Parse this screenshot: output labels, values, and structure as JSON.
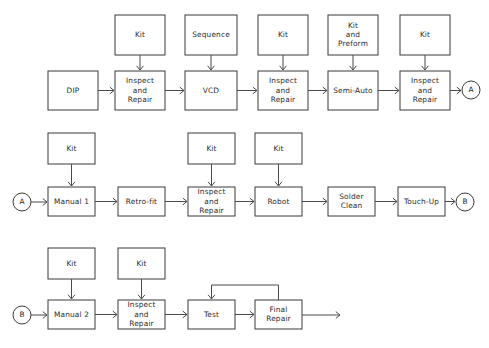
{
  "diagram": {
    "type": "process-flowchart",
    "background_color": "#ffffff",
    "line_color": "#4a4a4a",
    "box_stroke_color": "#3a3a3a",
    "text_color": "#2b2b2b",
    "rows": [
      {
        "id": "row-1",
        "feeder_boxes": [
          {
            "id": "r1-kit-1",
            "label": "Kit",
            "x": 115,
            "y": 15,
            "w": 50,
            "h": 40
          },
          {
            "id": "r1-sequence",
            "label": "Sequence",
            "x": 185,
            "y": 15,
            "w": 52,
            "h": 40
          },
          {
            "id": "r1-kit-2",
            "label": "Kit",
            "x": 258,
            "y": 15,
            "w": 50,
            "h": 40
          },
          {
            "id": "r1-kit-preform",
            "label": "Kit\nand\nPreform",
            "x": 328,
            "y": 15,
            "w": 50,
            "h": 40
          },
          {
            "id": "r1-kit-3",
            "label": "Kit",
            "x": 400,
            "y": 15,
            "w": 50,
            "h": 40
          }
        ],
        "process_boxes": [
          {
            "id": "r1-dip",
            "label": "DIP",
            "x": 48,
            "y": 71,
            "w": 50,
            "h": 39
          },
          {
            "id": "r1-inspect-1",
            "label": "Inspect\nand\nRepair",
            "x": 115,
            "y": 71,
            "w": 50,
            "h": 39
          },
          {
            "id": "r1-vcd",
            "label": "VCD",
            "x": 185,
            "y": 71,
            "w": 52,
            "h": 39
          },
          {
            "id": "r1-inspect-2",
            "label": "Inspect\nand\nRepair",
            "x": 258,
            "y": 71,
            "w": 50,
            "h": 39
          },
          {
            "id": "r1-semi-auto",
            "label": "Semi-Auto",
            "x": 328,
            "y": 71,
            "w": 50,
            "h": 39
          },
          {
            "id": "r1-inspect-3",
            "label": "Inspect\nand\nRepair",
            "x": 400,
            "y": 71,
            "w": 50,
            "h": 39
          }
        ],
        "connectors": [
          {
            "id": "r1-connector-a",
            "label": "A",
            "cx": 471,
            "cy": 90,
            "r": 9
          }
        ]
      },
      {
        "id": "row-2",
        "feeder_boxes": [
          {
            "id": "r2-kit-1",
            "label": "Kit",
            "x": 48,
            "y": 133,
            "w": 47,
            "h": 31
          },
          {
            "id": "r2-kit-2",
            "label": "Kit",
            "x": 188,
            "y": 133,
            "w": 47,
            "h": 31
          },
          {
            "id": "r2-kit-3",
            "label": "Kit",
            "x": 255,
            "y": 133,
            "w": 47,
            "h": 31
          }
        ],
        "process_boxes": [
          {
            "id": "r2-manual-1",
            "label": "Manual 1",
            "x": 48,
            "y": 187,
            "w": 47,
            "h": 29
          },
          {
            "id": "r2-retro-fit",
            "label": "Retro-fit",
            "x": 118,
            "y": 187,
            "w": 47,
            "h": 29
          },
          {
            "id": "r2-inspect",
            "label": "Inspect\nand\nRepair",
            "x": 188,
            "y": 187,
            "w": 47,
            "h": 29
          },
          {
            "id": "r2-robot",
            "label": "Robot",
            "x": 255,
            "y": 187,
            "w": 47,
            "h": 29
          },
          {
            "id": "r2-solder-clean",
            "label": "Solder\nClean",
            "x": 328,
            "y": 187,
            "w": 47,
            "h": 29
          },
          {
            "id": "r2-touch-up",
            "label": "Touch-Up",
            "x": 398,
            "y": 187,
            "w": 47,
            "h": 29
          }
        ],
        "connectors": [
          {
            "id": "r2-connector-a-in",
            "label": "A",
            "cx": 22,
            "cy": 202,
            "r": 9
          },
          {
            "id": "r2-connector-b-out",
            "label": "B",
            "cx": 465,
            "cy": 202,
            "r": 9
          }
        ]
      },
      {
        "id": "row-3",
        "feeder_boxes": [
          {
            "id": "r3-kit-1",
            "label": "Kit",
            "x": 48,
            "y": 248,
            "w": 47,
            "h": 31
          },
          {
            "id": "r3-kit-2",
            "label": "Kit",
            "x": 118,
            "y": 248,
            "w": 47,
            "h": 31
          }
        ],
        "process_boxes": [
          {
            "id": "r3-manual-2",
            "label": "Manual 2",
            "x": 48,
            "y": 300,
            "w": 47,
            "h": 29
          },
          {
            "id": "r3-inspect",
            "label": "Inspect\nand\nRepair",
            "x": 118,
            "y": 300,
            "w": 47,
            "h": 29
          },
          {
            "id": "r3-test",
            "label": "Test",
            "x": 188,
            "y": 300,
            "w": 47,
            "h": 29
          },
          {
            "id": "r3-final-repair",
            "label": "Final\nRepair",
            "x": 255,
            "y": 300,
            "w": 47,
            "h": 29
          }
        ],
        "connectors": [
          {
            "id": "r3-connector-b-in",
            "label": "B",
            "cx": 22,
            "cy": 315,
            "r": 9
          }
        ],
        "feedback_loop": {
          "id": "r3-rework-loop",
          "from": "r3-final-repair",
          "to": "r3-test",
          "top_y": 285
        },
        "exit_arrow": {
          "id": "r3-exit",
          "x1": 302,
          "x2": 340,
          "y": 315
        }
      }
    ]
  }
}
